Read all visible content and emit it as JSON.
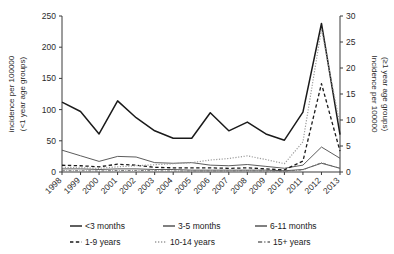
{
  "chart_data": {
    "type": "line",
    "title": "",
    "xlabel": "",
    "ylabel": "incidence per 100000 (<1 year age groups)",
    "y2label": "Incidence per 100000 (≥1 year age groups)",
    "grid": false,
    "legend_position": "bottom",
    "x": [
      "1998",
      "1999",
      "2000",
      "2001",
      "2002",
      "2003",
      "2004",
      "2005",
      "2006",
      "2007",
      "2008",
      "2009",
      "2010",
      "2011",
      "2012",
      "2013"
    ],
    "ylim": [
      0,
      250
    ],
    "yticks": [
      0,
      50,
      100,
      150,
      200,
      250
    ],
    "y2lim": [
      0,
      30
    ],
    "y2ticks": [
      0,
      5,
      10,
      15,
      20,
      25,
      30
    ],
    "series": [
      {
        "name": "<3 months",
        "axis": "left",
        "style": "solid",
        "color": "#1a1a1a",
        "width": 1.5,
        "values": [
          112,
          97,
          61,
          114,
          87,
          66,
          54,
          54,
          95,
          66,
          80,
          61,
          51,
          96,
          238,
          60
        ]
      },
      {
        "name": "3-5 months",
        "axis": "left",
        "style": "solid",
        "color": "#4a4a4a",
        "width": 0.9,
        "values": [
          35,
          26,
          17,
          25,
          24,
          15,
          14,
          15,
          11,
          10,
          12,
          9,
          6,
          11,
          40,
          22
        ]
      },
      {
        "name": "6-11 months",
        "axis": "left",
        "style": "solid",
        "color": "#4a4a4a",
        "width": 0.9,
        "values": [
          5,
          5,
          4,
          5,
          5,
          4,
          4,
          3,
          3,
          3,
          3,
          3,
          2,
          4,
          14,
          6
        ]
      },
      {
        "name": "1-9 years",
        "axis": "right",
        "style": "dashed",
        "color": "#1a1a1a",
        "width": 1.3,
        "values": [
          1.3,
          1.2,
          1.0,
          1.5,
          1.3,
          0.9,
          0.8,
          0.8,
          0.8,
          0.7,
          0.8,
          0.6,
          0.4,
          2.1,
          17.0,
          4.0
        ]
      },
      {
        "name": "10-14 years",
        "axis": "right",
        "style": "dotted",
        "color": "#9a9a9a",
        "width": 1.2,
        "values": [
          0.9,
          0.8,
          0.7,
          1.0,
          1.2,
          1.4,
          1.6,
          1.8,
          2.3,
          2.6,
          3.1,
          2.4,
          1.6,
          5.8,
          27.5,
          9.0
        ]
      },
      {
        "name": "15+ years",
        "axis": "right",
        "style": "dashdot",
        "color": "#6a6a6a",
        "width": 0.9,
        "values": [
          0.25,
          0.25,
          0.2,
          0.3,
          0.3,
          0.25,
          0.2,
          0.2,
          0.2,
          0.2,
          0.25,
          0.2,
          0.15,
          0.4,
          1.8,
          0.7
        ]
      }
    ]
  },
  "legend": {
    "row1": [
      {
        "label": "<3 months",
        "style": "solid",
        "color": "#1a1a1a"
      },
      {
        "label": "3-5 months",
        "style": "solid",
        "color": "#4a4a4a"
      },
      {
        "label": "6-11 months",
        "style": "solid",
        "color": "#4a4a4a"
      }
    ],
    "row2": [
      {
        "label": "1-9 years",
        "style": "dashed",
        "color": "#1a1a1a"
      },
      {
        "label": "10-14 years",
        "style": "dotted",
        "color": "#9a9a9a"
      },
      {
        "label": "15+ years",
        "style": "dashdot",
        "color": "#6a6a6a"
      }
    ]
  }
}
